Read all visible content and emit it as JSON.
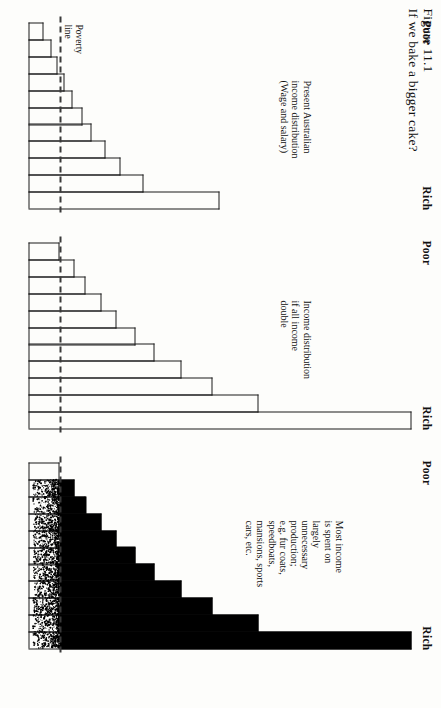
{
  "figure": {
    "number": "Figure 11.1",
    "title": "If we bake a bigger cake?",
    "poverty_line_label_1": "Poverty",
    "poverty_line_label_2": "line",
    "poor_label": "Poor",
    "rich_label": "Rich"
  },
  "chart_data": {
    "type": "bar",
    "title": "If we bake a bigger cake?",
    "orientation": "horizontal",
    "xlabel": "",
    "ylabel": "",
    "grid": false,
    "legend": null,
    "categories": [
      "Poor",
      "2",
      "3",
      "4",
      "5",
      "6",
      "7",
      "8",
      "9",
      "10",
      "Rich"
    ],
    "axis_ends": {
      "start": "Poor",
      "end": "Rich"
    },
    "poverty_line_value": 16,
    "panels": [
      {
        "name": "panel-present-distribution",
        "note_lines": [
          "Present Australian",
          "income distribution",
          "(Wage and salary)"
        ],
        "values": [
          8,
          12,
          15,
          19,
          23,
          28,
          33,
          40,
          48,
          60,
          100
        ],
        "shaded": false
      },
      {
        "name": "panel-doubled-distribution",
        "note_lines": [
          "Income distribution",
          "if all income",
          "double"
        ],
        "values": [
          16,
          24,
          30,
          38,
          46,
          56,
          66,
          80,
          96,
          120,
          200
        ],
        "shaded": false
      },
      {
        "name": "panel-unnecessary-production",
        "note_lines": [
          "Most income",
          "is spent on",
          "largely",
          "unnecessary",
          "production;",
          "e.g. fur coats,",
          "speedboats,",
          "mansions, sports",
          "cars, etc."
        ],
        "values": [
          16,
          24,
          30,
          38,
          46,
          56,
          66,
          80,
          96,
          120,
          200
        ],
        "shaded": true,
        "shade_threshold": 16
      }
    ],
    "scale_max": 200,
    "colors": {
      "ink": "#111111",
      "fill": "#000000",
      "paper": "#fdfdfb",
      "poverty_line": "#3a3a3a"
    }
  }
}
